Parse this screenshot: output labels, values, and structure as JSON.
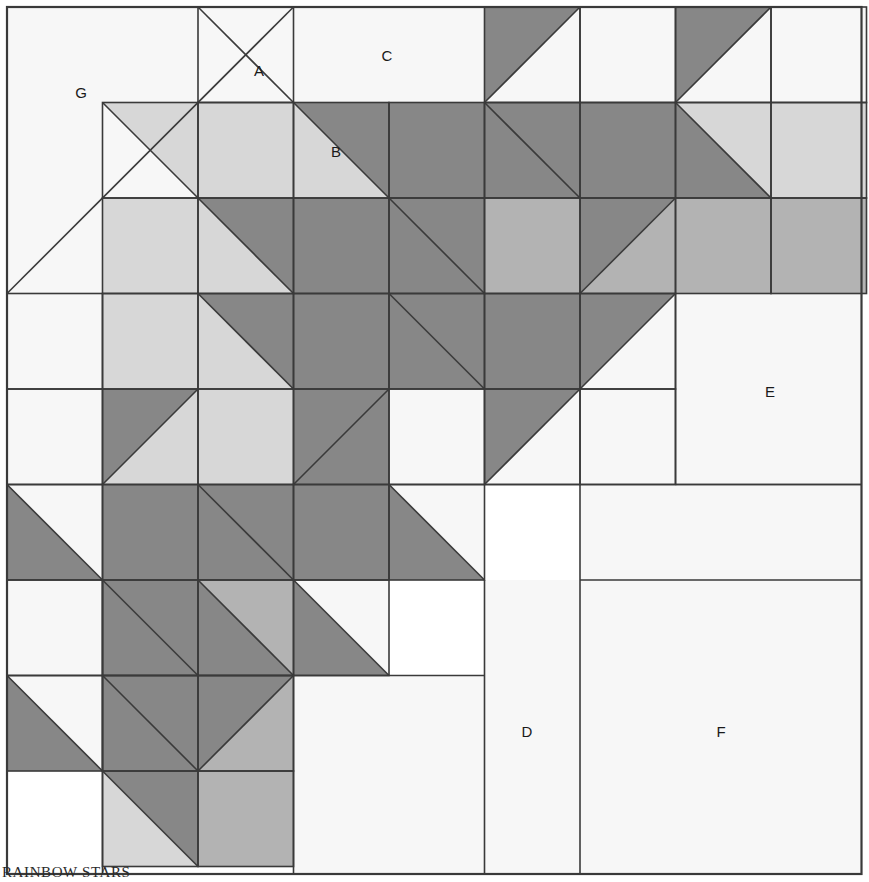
{
  "caption": "RAINBOW STARS",
  "palette": {
    "background": "#ffffff",
    "fabric_white": "#f7f7f7",
    "fabric_light": "#d7d7d7",
    "fabric_medium": "#b3b3b3",
    "fabric_dark": "#878787",
    "outline": "#3a3a3a",
    "label_text": "#1a1a1a"
  },
  "grid": {
    "origin_x": 7,
    "origin_y": 7,
    "cell": 95.5,
    "columns": 9,
    "rows": 9,
    "stroke_width": 1.6,
    "outer_stroke_width": 2.2
  },
  "legend_labels": [
    {
      "id": "A",
      "text": "A",
      "x": 259,
      "y": 72
    },
    {
      "id": "B",
      "text": "B",
      "x": 336,
      "y": 153
    },
    {
      "id": "C",
      "text": "C",
      "x": 387,
      "y": 57
    },
    {
      "id": "D",
      "text": "D",
      "x": 527,
      "y": 733
    },
    {
      "id": "E",
      "text": "E",
      "x": 770,
      "y": 393
    },
    {
      "id": "F",
      "text": "F",
      "x": 721,
      "y": 733
    },
    {
      "id": "G",
      "text": "G",
      "x": 81,
      "y": 94
    }
  ],
  "merged_regions": [
    {
      "name": "region-G",
      "x": 7,
      "y": 7,
      "w": 286.5,
      "h": 286.5,
      "fill": "fabric_white",
      "split": "diag-tl-br",
      "upper": "fabric_white",
      "lower": "fabric_white"
    },
    {
      "name": "region-C",
      "x": 293.5,
      "y": 7,
      "w": 191,
      "h": 95.5,
      "fill": "fabric_white"
    },
    {
      "name": "region-E",
      "x": 675.5,
      "y": 293.5,
      "w": 186,
      "h": 191,
      "fill": "fabric_white"
    },
    {
      "name": "region-F-top",
      "x": 580,
      "y": 484.5,
      "w": 281.5,
      "h": 95.5,
      "fill": "fabric_white"
    },
    {
      "name": "region-D",
      "x": 484.5,
      "y": 580,
      "w": 95.5,
      "h": 294,
      "fill": "fabric_white"
    },
    {
      "name": "region-F",
      "x": 580,
      "y": 580,
      "w": 281.5,
      "h": 294,
      "fill": "fabric_white"
    },
    {
      "name": "region-lower-left-white",
      "x": 7,
      "y": 675.5,
      "w": 95.5,
      "h": 95.5,
      "fill": "fabric_white"
    },
    {
      "name": "region-bottom-mid-white",
      "x": 293.5,
      "y": 675.5,
      "w": 191,
      "h": 198.5,
      "fill": "fabric_white"
    }
  ],
  "cells": [
    {
      "r": 0,
      "c": 0,
      "type": "merged"
    },
    {
      "r": 0,
      "c": 1,
      "type": "merged"
    },
    {
      "r": 0,
      "c": 2,
      "type": "hst-bl",
      "a": "fabric_white",
      "b": "fabric_white"
    },
    {
      "r": 0,
      "c": 3,
      "type": "merged"
    },
    {
      "r": 0,
      "c": 4,
      "type": "merged"
    },
    {
      "r": 0,
      "c": 5,
      "type": "hst-tl",
      "a": "fabric_dark",
      "b": "fabric_white"
    },
    {
      "r": 0,
      "c": 6,
      "type": "solid",
      "a": "fabric_white"
    },
    {
      "r": 0,
      "c": 7,
      "type": "hst-tl",
      "a": "fabric_dark",
      "b": "fabric_white"
    },
    {
      "r": 0,
      "c": 8,
      "type": "solid",
      "a": "fabric_white"
    },
    {
      "r": 1,
      "c": 0,
      "type": "merged"
    },
    {
      "r": 1,
      "c": 1,
      "type": "hst-br",
      "a": "fabric_white",
      "b": "fabric_light"
    },
    {
      "r": 1,
      "c": 2,
      "type": "solid",
      "a": "fabric_light"
    },
    {
      "r": 1,
      "c": 3,
      "type": "hst-br",
      "a": "fabric_light",
      "b": "fabric_dark"
    },
    {
      "r": 1,
      "c": 4,
      "type": "solid",
      "a": "fabric_dark"
    },
    {
      "r": 1,
      "c": 5,
      "type": "hst-br",
      "a": "fabric_dark",
      "b": "fabric_dark"
    },
    {
      "r": 1,
      "c": 6,
      "type": "solid",
      "a": "fabric_dark"
    },
    {
      "r": 1,
      "c": 7,
      "type": "hst-br",
      "a": "fabric_dark",
      "b": "fabric_light"
    },
    {
      "r": 1,
      "c": 8,
      "type": "solid",
      "a": "fabric_light"
    },
    {
      "r": 2,
      "c": 0,
      "type": "merged"
    },
    {
      "r": 2,
      "c": 1,
      "type": "solid",
      "a": "fabric_light"
    },
    {
      "r": 2,
      "c": 2,
      "type": "hst-br",
      "a": "fabric_light",
      "b": "fabric_dark"
    },
    {
      "r": 2,
      "c": 3,
      "type": "solid",
      "a": "fabric_dark"
    },
    {
      "r": 2,
      "c": 4,
      "type": "hst-br",
      "a": "fabric_dark",
      "b": "fabric_dark"
    },
    {
      "r": 2,
      "c": 5,
      "type": "solid",
      "a": "fabric_medium"
    },
    {
      "r": 2,
      "c": 6,
      "type": "hst-tl",
      "a": "fabric_dark",
      "b": "fabric_medium"
    },
    {
      "r": 2,
      "c": 7,
      "type": "solid",
      "a": "fabric_medium"
    },
    {
      "r": 2,
      "c": 8,
      "type": "solid",
      "a": "fabric_medium"
    },
    {
      "r": 3,
      "c": 0,
      "type": "solid",
      "a": "fabric_white"
    },
    {
      "r": 3,
      "c": 1,
      "type": "solid",
      "a": "fabric_light"
    },
    {
      "r": 3,
      "c": 2,
      "type": "hst-br",
      "a": "fabric_light",
      "b": "fabric_dark"
    },
    {
      "r": 3,
      "c": 3,
      "type": "solid",
      "a": "fabric_dark"
    },
    {
      "r": 3,
      "c": 4,
      "type": "hst-br",
      "a": "fabric_dark",
      "b": "fabric_dark"
    },
    {
      "r": 3,
      "c": 5,
      "type": "solid",
      "a": "fabric_dark"
    },
    {
      "r": 3,
      "c": 6,
      "type": "hst-tl",
      "a": "fabric_dark",
      "b": "fabric_white"
    },
    {
      "r": 3,
      "c": 7,
      "type": "merged"
    },
    {
      "r": 3,
      "c": 8,
      "type": "merged"
    },
    {
      "r": 4,
      "c": 0,
      "type": "solid",
      "a": "fabric_white"
    },
    {
      "r": 4,
      "c": 1,
      "type": "hst-tl",
      "a": "fabric_dark",
      "b": "fabric_light"
    },
    {
      "r": 4,
      "c": 2,
      "type": "solid",
      "a": "fabric_light"
    },
    {
      "r": 4,
      "c": 3,
      "type": "hst-tl",
      "a": "fabric_dark",
      "b": "fabric_dark"
    },
    {
      "r": 4,
      "c": 4,
      "type": "solid",
      "a": "fabric_white"
    },
    {
      "r": 4,
      "c": 5,
      "type": "hst-tl",
      "a": "fabric_dark",
      "b": "fabric_white"
    },
    {
      "r": 4,
      "c": 6,
      "type": "solid",
      "a": "fabric_white"
    },
    {
      "r": 4,
      "c": 7,
      "type": "merged"
    },
    {
      "r": 4,
      "c": 8,
      "type": "merged"
    },
    {
      "r": 5,
      "c": 0,
      "type": "hst-bl",
      "a": "fabric_white",
      "b": "fabric_dark"
    },
    {
      "r": 5,
      "c": 1,
      "type": "solid",
      "a": "fabric_dark"
    },
    {
      "r": 5,
      "c": 2,
      "type": "hst-br",
      "a": "fabric_dark",
      "b": "fabric_dark"
    },
    {
      "r": 5,
      "c": 3,
      "type": "solid",
      "a": "fabric_dark"
    },
    {
      "r": 5,
      "c": 4,
      "type": "hst-br",
      "a": "fabric_dark",
      "b": "fabric_white"
    },
    {
      "r": 5,
      "c": 5,
      "type": "merged"
    },
    {
      "r": 5,
      "c": 6,
      "type": "merged"
    },
    {
      "r": 5,
      "c": 7,
      "type": "merged"
    },
    {
      "r": 5,
      "c": 8,
      "type": "merged"
    },
    {
      "r": 6,
      "c": 0,
      "type": "solid",
      "a": "fabric_white"
    },
    {
      "r": 6,
      "c": 1,
      "type": "hst-br",
      "a": "fabric_dark",
      "b": "fabric_dark"
    },
    {
      "r": 6,
      "c": 2,
      "type": "hst-br",
      "a": "fabric_dark",
      "b": "fabric_medium"
    },
    {
      "r": 6,
      "c": 3,
      "type": "hst-br",
      "a": "fabric_dark",
      "b": "fabric_white"
    },
    {
      "r": 6,
      "c": 4,
      "type": "merged"
    },
    {
      "r": 6,
      "c": 5,
      "type": "merged"
    },
    {
      "r": 6,
      "c": 6,
      "type": "merged"
    },
    {
      "r": 6,
      "c": 7,
      "type": "merged"
    },
    {
      "r": 6,
      "c": 8,
      "type": "merged"
    },
    {
      "r": 7,
      "c": 0,
      "type": "hst-bl",
      "a": "fabric_white",
      "b": "fabric_dark"
    },
    {
      "r": 7,
      "c": 1,
      "type": "hst-br",
      "a": "fabric_dark",
      "b": "fabric_dark"
    },
    {
      "r": 7,
      "c": 2,
      "type": "hst-tl",
      "a": "fabric_dark",
      "b": "fabric_medium"
    },
    {
      "r": 7,
      "c": 3,
      "type": "merged"
    },
    {
      "r": 7,
      "c": 4,
      "type": "merged"
    },
    {
      "r": 7,
      "c": 5,
      "type": "merged"
    },
    {
      "r": 7,
      "c": 6,
      "type": "merged"
    },
    {
      "r": 7,
      "c": 7,
      "type": "merged"
    },
    {
      "r": 7,
      "c": 8,
      "type": "merged"
    },
    {
      "r": 8,
      "c": 0,
      "type": "merged"
    },
    {
      "r": 8,
      "c": 1,
      "type": "hst-br",
      "a": "fabric_light",
      "b": "fabric_dark"
    },
    {
      "r": 8,
      "c": 2,
      "type": "solid",
      "a": "fabric_medium"
    },
    {
      "r": 8,
      "c": 3,
      "type": "merged"
    },
    {
      "r": 8,
      "c": 4,
      "type": "merged"
    },
    {
      "r": 8,
      "c": 5,
      "type": "merged"
    },
    {
      "r": 8,
      "c": 6,
      "type": "merged"
    },
    {
      "r": 8,
      "c": 7,
      "type": "merged"
    },
    {
      "r": 8,
      "c": 8,
      "type": "merged"
    }
  ],
  "extra_edges": [
    {
      "name": "edge-G-diagonal",
      "x1": 7,
      "y1": 293.5,
      "x2": 293.5,
      "y2": 7
    },
    {
      "name": "edge-region-e-left",
      "x1": 675.5,
      "y1": 293.5,
      "x2": 675.5,
      "y2": 484.5
    },
    {
      "name": "edge-region-e-bottom",
      "x1": 675.5,
      "y1": 484.5,
      "x2": 861.5,
      "y2": 484.5
    },
    {
      "name": "edge-row5-right-top",
      "x1": 484.5,
      "y1": 484.5,
      "x2": 861.5,
      "y2": 484.5
    },
    {
      "name": "edge-f-top",
      "x1": 580,
      "y1": 580,
      "x2": 861.5,
      "y2": 580
    },
    {
      "name": "edge-d-left",
      "x1": 484.5,
      "y1": 580,
      "x2": 484.5,
      "y2": 874
    },
    {
      "name": "edge-d-right",
      "x1": 580,
      "y1": 484.5,
      "x2": 580,
      "y2": 874
    },
    {
      "name": "edge-bottom-white-left",
      "x1": 293.5,
      "y1": 675.5,
      "x2": 293.5,
      "y2": 874
    },
    {
      "name": "edge-bottom-white-top",
      "x1": 102.5,
      "y1": 675.5,
      "x2": 484.5,
      "y2": 675.5
    },
    {
      "name": "edge-col1-lower",
      "x1": 102.5,
      "y1": 580,
      "x2": 102.5,
      "y2": 874
    }
  ],
  "frame": {
    "x": 7,
    "y": 7,
    "width": 854.5,
    "height": 867
  }
}
